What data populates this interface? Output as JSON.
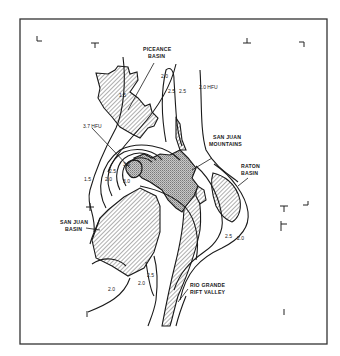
{
  "figure": {
    "type": "geologic heat-flow contour map",
    "frame": {
      "x": 20,
      "y": 19,
      "width": 307,
      "height": 325,
      "stroke": "#333333"
    }
  },
  "regions": {
    "piceance_basin": {
      "label_line1": "PICEANCE",
      "label_line2": "BASIN"
    },
    "san_juan_mountains": {
      "label_line1": "SAN JUAN",
      "label_line2": "MOUNTAINS"
    },
    "raton_basin": {
      "label_line1": "RATON",
      "label_line2": "BASIN"
    },
    "san_juan_basin": {
      "label_line1": "SAN JUAN",
      "label_line2": "BASIN"
    },
    "rio_grande_rift": {
      "label_line1": "RIO GRANDE",
      "label_line2": "RIFT VALLEY"
    }
  },
  "contour_labels": {
    "peak": "3.7 HFU",
    "east": "2.0 HFU",
    "c_1_5_north": "1.5",
    "c_2_0_north": "2.0",
    "c_2_5_a": "2.5",
    "c_2_5_b": "2.5",
    "c_1_5_west": "1.5",
    "c_2_0_west": "2.0",
    "c_2_5_west": "2.5",
    "c_3_0_west": "3.0",
    "c_3_5_core": "3.5",
    "c_2_5_south": "2.5",
    "c_2_0_south": "2.0",
    "c_2_0_sw": "2.0",
    "c_2_5_raton": "2.5",
    "c_2_0_raton": "2.0"
  },
  "colors": {
    "ink": "#1a1a1a",
    "paper": "#ffffff",
    "stipple": "#9a9a9a"
  }
}
